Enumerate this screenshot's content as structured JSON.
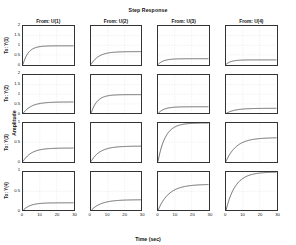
{
  "figure": {
    "title": "Step Response",
    "xlabel": "Time (sec)",
    "ylabel": "Amplitude",
    "line_color": "#1a1a1a",
    "grid_color": "#c8c8c8",
    "axis_color": "#333333",
    "background": "#ffffff"
  },
  "chart_data": {
    "type": "line",
    "title": "Step Response",
    "xlabel": "Time (sec)",
    "ylabel": "Amplitude",
    "grid": true,
    "legend": "none",
    "layout": {
      "rows": 4,
      "cols": 4
    },
    "col_headers": [
      "From: U(1)",
      "From: U(2)",
      "From: U(3)",
      "From: U(4)"
    ],
    "row_headers": [
      "To: Y(1)",
      "To: Y(2)",
      "To: Y(3)",
      "To: Y(4)"
    ],
    "xlim": [
      0,
      30
    ],
    "xticks": [
      0,
      10,
      20,
      30
    ],
    "xticklabels": [
      "0",
      "10",
      "20",
      "30"
    ],
    "row_ylim": [
      [
        0,
        2
      ],
      [
        0,
        2
      ],
      [
        0,
        1
      ],
      [
        0,
        1
      ]
    ],
    "row_yticks": [
      [
        0,
        0.5,
        1,
        1.5,
        2
      ],
      [
        0,
        0.5,
        1,
        1.5,
        2
      ],
      [
        0,
        0.5,
        1
      ],
      [
        0,
        0.5,
        1
      ]
    ],
    "row_yticklabels": [
      [
        "0",
        "0.5",
        "1",
        "1.5",
        "2"
      ],
      [
        "0",
        "0.5",
        "1",
        "1.5",
        "2"
      ],
      [
        "0",
        "0.5",
        "1"
      ],
      [
        "0",
        "0.5",
        "1"
      ]
    ],
    "panels": [
      [
        {
          "row": "To: Y(1)",
          "col": "From: U(1)",
          "gain": 0.97,
          "tau": 3.2,
          "ylim": [
            0,
            2
          ]
        },
        {
          "row": "To: Y(1)",
          "col": "From: U(2)",
          "gain": 0.67,
          "tau": 4.6,
          "ylim": [
            0,
            2
          ]
        },
        {
          "row": "To: Y(1)",
          "col": "From: U(3)",
          "gain": 0.3,
          "tau": 3.4,
          "ylim": [
            0,
            2
          ]
        },
        {
          "row": "To: Y(1)",
          "col": "From: U(4)",
          "gain": 0.24,
          "tau": 3.0,
          "ylim": [
            0,
            2
          ]
        }
      ],
      [
        {
          "row": "To: Y(2)",
          "col": "From: U(1)",
          "gain": 0.6,
          "tau": 5.0,
          "ylim": [
            0,
            2
          ]
        },
        {
          "row": "To: Y(2)",
          "col": "From: U(2)",
          "gain": 0.98,
          "tau": 3.6,
          "ylim": [
            0,
            2
          ]
        },
        {
          "row": "To: Y(2)",
          "col": "From: U(3)",
          "gain": 0.35,
          "tau": 3.6,
          "ylim": [
            0,
            2
          ]
        },
        {
          "row": "To: Y(2)",
          "col": "From: U(4)",
          "gain": 0.27,
          "tau": 5.2,
          "ylim": [
            0,
            2
          ]
        }
      ],
      [
        {
          "row": "To: Y(3)",
          "col": "From: U(1)",
          "gain": 0.35,
          "tau": 5.0,
          "ylim": [
            0,
            1
          ]
        },
        {
          "row": "To: Y(3)",
          "col": "From: U(2)",
          "gain": 0.4,
          "tau": 5.4,
          "ylim": [
            0,
            1
          ]
        },
        {
          "row": "To: Y(3)",
          "col": "From: U(3)",
          "gain": 1.0,
          "tau": 4.4,
          "ylim": [
            0,
            1
          ]
        },
        {
          "row": "To: Y(3)",
          "col": "From: U(4)",
          "gain": 0.62,
          "tau": 6.2,
          "ylim": [
            0,
            1
          ]
        }
      ],
      [
        {
          "row": "To: Y(4)",
          "col": "From: U(1)",
          "gain": 0.2,
          "tau": 4.2,
          "ylim": [
            0,
            1
          ]
        },
        {
          "row": "To: Y(4)",
          "col": "From: U(2)",
          "gain": 0.28,
          "tau": 6.0,
          "ylim": [
            0,
            1
          ]
        },
        {
          "row": "To: Y(4)",
          "col": "From: U(3)",
          "gain": 0.68,
          "tau": 6.4,
          "ylim": [
            0,
            1
          ]
        },
        {
          "row": "To: Y(4)",
          "col": "From: U(4)",
          "gain": 1.0,
          "tau": 5.6,
          "ylim": [
            0,
            1
          ]
        }
      ]
    ]
  }
}
